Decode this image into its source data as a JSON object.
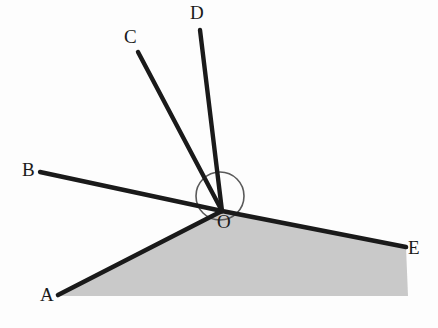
{
  "figure": {
    "background_color": "#fdfdfd",
    "shade_color": "#c9c9c9",
    "line_color": "#1a1a1a",
    "arc_color": "#4a4a4a",
    "labels": {
      "A": "A",
      "B": "B",
      "C": "C",
      "D": "D",
      "E": "E",
      "O": "O"
    },
    "vertex": {
      "name": "O",
      "x": 222,
      "y": 211
    },
    "rays": [
      {
        "name": "OA",
        "endpoint_label": "A",
        "x": 58,
        "y": 295
      },
      {
        "name": "OB",
        "endpoint_label": "B",
        "x": 40,
        "y": 172
      },
      {
        "name": "OC",
        "endpoint_label": "C",
        "x": 138,
        "y": 52
      },
      {
        "name": "OD",
        "endpoint_label": "D",
        "x": 200,
        "y": 30
      },
      {
        "name": "OE",
        "endpoint_label": "E",
        "x": 406,
        "y": 247
      }
    ],
    "arc": {
      "name": "angle-arc",
      "cx": 220,
      "cy": 196,
      "r": 24
    },
    "shaded_region": {
      "name": "shaded-region-AOE",
      "description": "region bounded below by rays OA and OE"
    }
  }
}
